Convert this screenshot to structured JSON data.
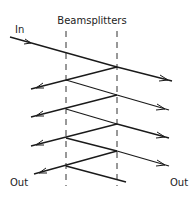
{
  "diagram": {
    "title": "Beamsplitters",
    "labels": {
      "input": "In",
      "output_left": "Out",
      "output_right": "Out"
    },
    "components": {
      "beamsplitters": [
        {
          "id": "left-beamsplitter",
          "type": "dashed-line"
        },
        {
          "id": "right-beamsplitter",
          "type": "dashed-line"
        }
      ]
    },
    "beam_description": "Input beam enters from the upper left and is repeatedly split between two parallel beamsplitters, producing a series of transmitted beams exiting right and reflected beams exiting left.",
    "transmitted_beams_right": 4,
    "reflected_beams_left": 4
  }
}
